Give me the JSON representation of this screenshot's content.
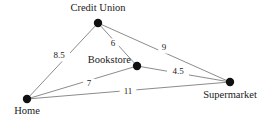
{
  "figure": {
    "background_color": "#ffffff",
    "node_color": "#111111",
    "edge_color": "#8c8c8c",
    "text_color": "#1a1a1a"
  },
  "chart_data": {
    "type": "diagram",
    "diagram_kind": "weighted-undirected-graph",
    "title": "",
    "nodes": [
      {
        "id": "credit_union",
        "label": "Credit Union",
        "x": 98,
        "y": 23,
        "label_x": 98,
        "label_y": 9,
        "label_anchor": "middle"
      },
      {
        "id": "bookstore",
        "label": "Bookstore",
        "x": 137,
        "y": 66,
        "label_x": 131,
        "label_y": 61,
        "label_anchor": "end"
      },
      {
        "id": "home",
        "label": "Home",
        "x": 27,
        "y": 99,
        "label_x": 27,
        "label_y": 112,
        "label_anchor": "middle"
      },
      {
        "id": "supermarket",
        "label": "Supermarket",
        "x": 230,
        "y": 82,
        "label_x": 230,
        "label_y": 96,
        "label_anchor": "middle"
      }
    ],
    "edges": [
      {
        "id": "home-credit_union",
        "source": "home",
        "target": "credit_union",
        "weight": "8.5",
        "label_x": 59,
        "label_y": 56
      },
      {
        "id": "credit_union-bookstore",
        "source": "credit_union",
        "target": "bookstore",
        "weight": "6",
        "label_x": 113,
        "label_y": 44
      },
      {
        "id": "credit_union-supermarket",
        "source": "credit_union",
        "target": "supermarket",
        "weight": "9",
        "label_x": 164,
        "label_y": 48
      },
      {
        "id": "bookstore-supermarket",
        "source": "bookstore",
        "target": "supermarket",
        "weight": "4.5",
        "label_x": 178,
        "label_y": 72
      },
      {
        "id": "home-bookstore",
        "source": "home",
        "target": "bookstore",
        "weight": "7",
        "label_x": 89,
        "label_y": 84
      },
      {
        "id": "home-supermarket",
        "source": "home",
        "target": "supermarket",
        "weight": "11",
        "label_x": 128,
        "label_y": 92
      }
    ],
    "node_radius": 4.2,
    "legend": null,
    "grid": false
  }
}
